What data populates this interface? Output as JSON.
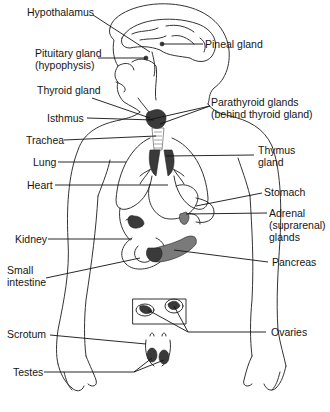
{
  "diagram": {
    "title": "",
    "colors": {
      "background": "#ffffff",
      "outline": "#333333",
      "gland_fill": "#3a3a3a",
      "gland_fill_light": "#7a7a7a",
      "text": "#151515"
    },
    "labels_left": [
      {
        "id": "hypothalamus",
        "lines": [
          "Hypothalamus"
        ]
      },
      {
        "id": "pituitary",
        "lines": [
          "Pituitary gland",
          "(hypophysis)"
        ]
      },
      {
        "id": "thyroid",
        "lines": [
          "Thyroid gland"
        ]
      },
      {
        "id": "isthmus",
        "lines": [
          "Isthmus"
        ]
      },
      {
        "id": "trachea",
        "lines": [
          "Trachea"
        ]
      },
      {
        "id": "lung",
        "lines": [
          "Lung"
        ]
      },
      {
        "id": "heart",
        "lines": [
          "Heart"
        ]
      },
      {
        "id": "kidney",
        "lines": [
          "Kidney"
        ]
      },
      {
        "id": "small-intestine",
        "lines": [
          "Small",
          "intestine"
        ]
      },
      {
        "id": "scrotum",
        "lines": [
          "Scrotum"
        ]
      },
      {
        "id": "testes",
        "lines": [
          "Testes"
        ]
      }
    ],
    "labels_right": [
      {
        "id": "pineal",
        "lines": [
          "Pineal gland"
        ]
      },
      {
        "id": "parathyroid",
        "lines": [
          "Parathyroid glands",
          "(behind thyroid gland)"
        ]
      },
      {
        "id": "thymus",
        "lines": [
          "Thymus",
          "gland"
        ]
      },
      {
        "id": "stomach",
        "lines": [
          "Stomach"
        ]
      },
      {
        "id": "adrenal",
        "lines": [
          "Adrenal",
          "(suprarenal)",
          "glands"
        ]
      },
      {
        "id": "pancreas",
        "lines": [
          "Pancreas"
        ]
      },
      {
        "id": "ovaries",
        "lines": [
          "Ovaries"
        ]
      }
    ]
  }
}
